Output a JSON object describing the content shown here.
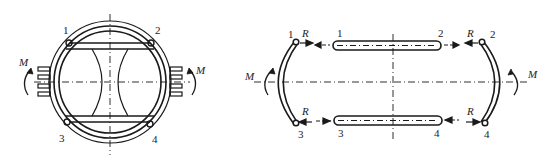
{
  "figures": {
    "left": {
      "description": "Ring frame with two horizontal bars and waisted link, moment M applied at sides",
      "labels": {
        "node1": "1",
        "node2": "2",
        "node3": "3",
        "node4": "4",
        "moment_left": "M",
        "moment_right": "M"
      }
    },
    "right": {
      "description": "Exploded free-body diagram: two arcs and two bars with reaction forces R at joints 1-4",
      "labels": {
        "arc_left_top": "1",
        "arc_left_bottom": "3",
        "arc_right_top": "2",
        "arc_right_bottom": "4",
        "bar_top_left": "1",
        "bar_top_right": "2",
        "bar_bottom_left": "3",
        "bar_bottom_right": "4",
        "force_tl": "R",
        "force_tr": "R",
        "force_bl": "R",
        "force_br": "R",
        "moment_left": "M",
        "moment_right": "M"
      }
    }
  },
  "colors": {
    "stroke": "#1a1a1a",
    "background": "#ffffff"
  }
}
